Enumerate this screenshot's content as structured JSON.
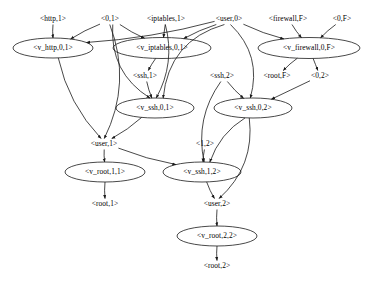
{
  "diagram": {
    "type": "directed-graph",
    "background_color": "#ffffff",
    "stroke_color": "#1a1a1a",
    "node_shapes": {
      "derivation": "ellipse",
      "fact": "plain-text"
    },
    "nodes": [
      {
        "id": "http_1",
        "label": "<http,1>",
        "kind": "fact",
        "cx": 53,
        "cy": 19,
        "rx": 0,
        "ry": 0
      },
      {
        "id": "zero_1",
        "label": "<0,1>",
        "kind": "fact",
        "cx": 110,
        "cy": 19,
        "rx": 0,
        "ry": 0
      },
      {
        "id": "iptables_1",
        "label": "<iptables,1>",
        "kind": "fact",
        "cx": 166,
        "cy": 19,
        "rx": 0,
        "ry": 0
      },
      {
        "id": "user_0",
        "label": "<user,0>",
        "kind": "fact",
        "cx": 229,
        "cy": 19,
        "rx": 0,
        "ry": 0
      },
      {
        "id": "firewall_F",
        "label": "<firewall,F>",
        "kind": "fact",
        "cx": 288,
        "cy": 19,
        "rx": 0,
        "ry": 0
      },
      {
        "id": "zero_F",
        "label": "<0,F>",
        "kind": "fact",
        "cx": 342,
        "cy": 19,
        "rx": 0,
        "ry": 0
      },
      {
        "id": "v_http_01",
        "label": "<v_http,0,1>",
        "kind": "derivation",
        "cx": 53,
        "cy": 48,
        "rx": 40,
        "ry": 10
      },
      {
        "id": "v_iptables_01",
        "label": "<v_iptables,0,1>",
        "kind": "derivation",
        "cx": 162,
        "cy": 48,
        "rx": 49,
        "ry": 10.5
      },
      {
        "id": "v_firewall_0F",
        "label": "<v_firewall,0,F>",
        "kind": "derivation",
        "cx": 309,
        "cy": 48,
        "rx": 51,
        "ry": 10.5
      },
      {
        "id": "ssh_1",
        "label": "<ssh,1>",
        "kind": "fact",
        "cx": 145,
        "cy": 76,
        "rx": 0,
        "ry": 0
      },
      {
        "id": "ssh_2",
        "label": "<ssh,2>",
        "kind": "fact",
        "cx": 222,
        "cy": 76,
        "rx": 0,
        "ry": 0
      },
      {
        "id": "root_F",
        "label": "<root,F>",
        "kind": "fact",
        "cx": 277,
        "cy": 76,
        "rx": 0,
        "ry": 0
      },
      {
        "id": "zero_2",
        "label": "<0,2>",
        "kind": "fact",
        "cx": 320,
        "cy": 76,
        "rx": 0,
        "ry": 0
      },
      {
        "id": "v_ssh_01",
        "label": "<v_ssh,0,1>",
        "kind": "derivation",
        "cx": 155,
        "cy": 108,
        "rx": 39,
        "ry": 10
      },
      {
        "id": "v_ssh_02",
        "label": "<v_ssh,0,2>",
        "kind": "derivation",
        "cx": 253,
        "cy": 108,
        "rx": 39,
        "ry": 10
      },
      {
        "id": "user_1",
        "label": "<user,1>",
        "kind": "fact",
        "cx": 104,
        "cy": 144,
        "rx": 0,
        "ry": 0
      },
      {
        "id": "one_2",
        "label": "<1,2>",
        "kind": "fact",
        "cx": 205,
        "cy": 144,
        "rx": 0,
        "ry": 0
      },
      {
        "id": "v_root_11",
        "label": "<v_root,1,1>",
        "kind": "derivation",
        "cx": 105,
        "cy": 172,
        "rx": 40,
        "ry": 10
      },
      {
        "id": "v_ssh_12",
        "label": "<v_ssh,1,2>",
        "kind": "derivation",
        "cx": 202,
        "cy": 172,
        "rx": 39,
        "ry": 10
      },
      {
        "id": "root_1",
        "label": "<root,1>",
        "kind": "fact",
        "cx": 105,
        "cy": 204,
        "rx": 0,
        "ry": 0
      },
      {
        "id": "user_2",
        "label": "<user,2>",
        "kind": "fact",
        "cx": 217,
        "cy": 204,
        "rx": 0,
        "ry": 0
      },
      {
        "id": "v_root_22",
        "label": "<v_root,2,2>",
        "kind": "derivation",
        "cx": 217,
        "cy": 236,
        "rx": 40,
        "ry": 10
      },
      {
        "id": "root_2",
        "label": "<root,2>",
        "kind": "fact",
        "cx": 217,
        "cy": 266,
        "rx": 0,
        "ry": 0
      }
    ],
    "edges": [
      {
        "from": "http_1",
        "to": "v_http_01"
      },
      {
        "from": "zero_1",
        "to": "v_http_01"
      },
      {
        "from": "user_0",
        "to": "v_http_01"
      },
      {
        "from": "iptables_1",
        "to": "v_iptables_01"
      },
      {
        "from": "zero_1",
        "to": "v_iptables_01"
      },
      {
        "from": "user_0",
        "to": "v_iptables_01"
      },
      {
        "from": "firewall_F",
        "to": "v_firewall_0F"
      },
      {
        "from": "zero_F",
        "to": "v_firewall_0F"
      },
      {
        "from": "user_0",
        "to": "v_firewall_0F"
      },
      {
        "from": "v_iptables_01",
        "to": "ssh_1"
      },
      {
        "from": "v_firewall_0F",
        "to": "root_F"
      },
      {
        "from": "v_firewall_0F",
        "to": "zero_2"
      },
      {
        "from": "ssh_1",
        "to": "v_ssh_01"
      },
      {
        "from": "zero_1",
        "to": "v_ssh_01"
      },
      {
        "from": "user_0",
        "to": "v_ssh_01"
      },
      {
        "from": "iptables_1",
        "to": "v_ssh_01"
      },
      {
        "from": "ssh_2",
        "to": "v_ssh_02"
      },
      {
        "from": "user_0",
        "to": "v_ssh_02"
      },
      {
        "from": "zero_2",
        "to": "v_ssh_02"
      },
      {
        "from": "v_http_01",
        "to": "user_1"
      },
      {
        "from": "v_ssh_01",
        "to": "user_1"
      },
      {
        "from": "zero_1",
        "to": "user_1"
      },
      {
        "from": "user_1",
        "to": "v_root_11"
      },
      {
        "from": "user_1",
        "to": "v_ssh_12"
      },
      {
        "from": "one_2",
        "to": "v_ssh_12"
      },
      {
        "from": "ssh_2",
        "to": "v_ssh_12"
      },
      {
        "from": "v_ssh_02",
        "to": "v_ssh_12"
      },
      {
        "from": "v_root_11",
        "to": "root_1"
      },
      {
        "from": "v_ssh_12",
        "to": "user_2"
      },
      {
        "from": "v_ssh_02",
        "to": "user_2"
      },
      {
        "from": "user_2",
        "to": "v_root_22"
      },
      {
        "from": "v_root_22",
        "to": "root_2"
      }
    ]
  }
}
